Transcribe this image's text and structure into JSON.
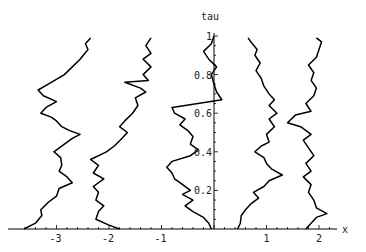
{
  "chart_data": {
    "type": "line",
    "title": "",
    "xlabel": "x",
    "ylabel": "tau",
    "xlim": [
      -3.75,
      2.3
    ],
    "ylim": [
      0,
      1.0
    ],
    "grid": false,
    "legend": "none",
    "x_ticks": [
      -3,
      -2,
      -1,
      1,
      2
    ],
    "x_tick_labels": [
      "-3",
      "-2",
      "-1",
      "1",
      "2"
    ],
    "y_ticks": [
      0.2,
      0.4,
      0.6,
      0.8,
      1
    ],
    "y_tick_labels": [
      "0.2",
      "0.4",
      "0.6",
      "0.8",
      "1"
    ],
    "series": [
      {
        "name": "path-1",
        "points": [
          [
            -3.62,
            0.0
          ],
          [
            -3.4,
            0.03
          ],
          [
            -3.28,
            0.07
          ],
          [
            -3.3,
            0.1
          ],
          [
            -3.15,
            0.14
          ],
          [
            -3.0,
            0.17
          ],
          [
            -2.95,
            0.21
          ],
          [
            -2.7,
            0.24
          ],
          [
            -2.8,
            0.27
          ],
          [
            -2.95,
            0.3
          ],
          [
            -2.9,
            0.33
          ],
          [
            -2.92,
            0.37
          ],
          [
            -3.05,
            0.4
          ],
          [
            -2.85,
            0.44
          ],
          [
            -2.7,
            0.47
          ],
          [
            -2.55,
            0.49
          ],
          [
            -2.75,
            0.51
          ],
          [
            -2.9,
            0.53
          ],
          [
            -3.0,
            0.56
          ],
          [
            -3.1,
            0.58
          ],
          [
            -3.3,
            0.6
          ],
          [
            -3.2,
            0.63
          ],
          [
            -3.0,
            0.66
          ],
          [
            -3.25,
            0.69
          ],
          [
            -3.35,
            0.72
          ],
          [
            -3.1,
            0.76
          ],
          [
            -2.85,
            0.8
          ],
          [
            -2.7,
            0.84
          ],
          [
            -2.55,
            0.88
          ],
          [
            -2.4,
            0.93
          ],
          [
            -2.45,
            0.96
          ],
          [
            -2.35,
            0.99
          ]
        ]
      },
      {
        "name": "path-2",
        "points": [
          [
            -1.8,
            0.0
          ],
          [
            -2.0,
            0.02
          ],
          [
            -2.25,
            0.05
          ],
          [
            -2.2,
            0.09
          ],
          [
            -2.1,
            0.12
          ],
          [
            -2.25,
            0.15
          ],
          [
            -2.2,
            0.19
          ],
          [
            -2.3,
            0.22
          ],
          [
            -2.1,
            0.26
          ],
          [
            -2.3,
            0.29
          ],
          [
            -2.2,
            0.33
          ],
          [
            -2.35,
            0.36
          ],
          [
            -2.05,
            0.4
          ],
          [
            -1.9,
            0.43
          ],
          [
            -1.75,
            0.47
          ],
          [
            -1.65,
            0.5
          ],
          [
            -1.8,
            0.53
          ],
          [
            -1.7,
            0.56
          ],
          [
            -1.55,
            0.6
          ],
          [
            -1.45,
            0.64
          ],
          [
            -1.5,
            0.68
          ],
          [
            -1.3,
            0.71
          ],
          [
            -1.4,
            0.73
          ],
          [
            -1.7,
            0.76
          ],
          [
            -1.25,
            0.77
          ],
          [
            -1.35,
            0.8
          ],
          [
            -1.2,
            0.84
          ],
          [
            -1.35,
            0.88
          ],
          [
            -1.2,
            0.91
          ],
          [
            -1.3,
            0.95
          ],
          [
            -1.2,
            0.99
          ]
        ]
      },
      {
        "name": "path-3",
        "points": [
          [
            -0.05,
            0.0
          ],
          [
            -0.1,
            0.03
          ],
          [
            -0.2,
            0.06
          ],
          [
            -0.4,
            0.09
          ],
          [
            -0.55,
            0.12
          ],
          [
            -0.4,
            0.15
          ],
          [
            -0.6,
            0.18
          ],
          [
            -0.45,
            0.2
          ],
          [
            -0.65,
            0.24
          ],
          [
            -0.75,
            0.26
          ],
          [
            -0.8,
            0.29
          ],
          [
            -0.9,
            0.32
          ],
          [
            -0.8,
            0.35
          ],
          [
            -0.45,
            0.38
          ],
          [
            -0.3,
            0.41
          ],
          [
            -0.45,
            0.44
          ],
          [
            -0.4,
            0.48
          ],
          [
            -0.5,
            0.51
          ],
          [
            -0.65,
            0.54
          ],
          [
            -0.55,
            0.57
          ],
          [
            -0.75,
            0.6
          ],
          [
            -0.8,
            0.63
          ],
          [
            -0.55,
            0.64
          ],
          [
            0.15,
            0.67
          ],
          [
            0.05,
            0.71
          ],
          [
            0.0,
            0.75
          ],
          [
            -0.05,
            0.8
          ],
          [
            0.05,
            0.84
          ],
          [
            -0.1,
            0.88
          ],
          [
            -0.2,
            0.92
          ],
          [
            -0.05,
            0.96
          ],
          [
            0.0,
            1.0
          ]
        ]
      },
      {
        "name": "path-4",
        "points": [
          [
            0.45,
            0.0
          ],
          [
            0.5,
            0.03
          ],
          [
            0.52,
            0.07
          ],
          [
            0.6,
            0.1
          ],
          [
            0.7,
            0.13
          ],
          [
            0.85,
            0.16
          ],
          [
            0.75,
            0.19
          ],
          [
            0.95,
            0.22
          ],
          [
            1.05,
            0.25
          ],
          [
            1.3,
            0.28
          ],
          [
            1.1,
            0.31
          ],
          [
            1.0,
            0.34
          ],
          [
            0.95,
            0.37
          ],
          [
            0.78,
            0.4
          ],
          [
            0.9,
            0.43
          ],
          [
            1.05,
            0.45
          ],
          [
            1.0,
            0.49
          ],
          [
            1.15,
            0.53
          ],
          [
            1.05,
            0.57
          ],
          [
            1.2,
            0.6
          ],
          [
            1.05,
            0.64
          ],
          [
            1.15,
            0.67
          ],
          [
            1.05,
            0.7
          ],
          [
            0.95,
            0.74
          ],
          [
            0.9,
            0.78
          ],
          [
            0.8,
            0.82
          ],
          [
            0.88,
            0.86
          ],
          [
            0.78,
            0.9
          ],
          [
            0.82,
            0.93
          ],
          [
            0.7,
            0.97
          ],
          [
            0.65,
            0.99
          ]
        ]
      },
      {
        "name": "path-5",
        "points": [
          [
            1.75,
            0.0
          ],
          [
            1.85,
            0.03
          ],
          [
            1.95,
            0.06
          ],
          [
            2.15,
            0.08
          ],
          [
            1.95,
            0.11
          ],
          [
            1.9,
            0.15
          ],
          [
            1.8,
            0.19
          ],
          [
            1.85,
            0.23
          ],
          [
            1.7,
            0.27
          ],
          [
            1.85,
            0.3
          ],
          [
            1.75,
            0.34
          ],
          [
            1.9,
            0.38
          ],
          [
            1.8,
            0.42
          ],
          [
            1.7,
            0.46
          ],
          [
            1.85,
            0.49
          ],
          [
            1.65,
            0.53
          ],
          [
            1.4,
            0.55
          ],
          [
            1.55,
            0.59
          ],
          [
            1.85,
            0.61
          ],
          [
            1.75,
            0.65
          ],
          [
            1.9,
            0.69
          ],
          [
            1.95,
            0.73
          ],
          [
            1.85,
            0.77
          ],
          [
            1.9,
            0.81
          ],
          [
            1.8,
            0.85
          ],
          [
            1.95,
            0.89
          ],
          [
            2.0,
            0.93
          ],
          [
            2.05,
            0.97
          ],
          [
            1.95,
            0.99
          ]
        ]
      }
    ]
  }
}
